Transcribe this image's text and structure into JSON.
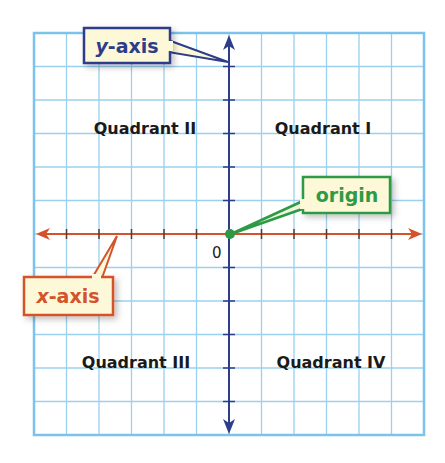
{
  "diagram": {
    "grid": {
      "columns": 12,
      "rows": 12,
      "line_color": "#9bd0ee",
      "border_color": "#7cc2ea"
    },
    "axes": {
      "x": {
        "label": "x-axis",
        "label_italic_part": "x",
        "label_rest": "-axis",
        "color": "#d4532a"
      },
      "y": {
        "label": "y-axis",
        "label_italic_part": "y",
        "label_rest": "-axis",
        "color": "#2e3d8a"
      }
    },
    "origin": {
      "label": "origin",
      "zero_label": "0",
      "color": "#2e9a46"
    },
    "quadrants": [
      {
        "id": "I",
        "label": "Quadrant I"
      },
      {
        "id": "II",
        "label": "Quadrant II"
      },
      {
        "id": "III",
        "label": "Quadrant III"
      },
      {
        "id": "IV",
        "label": "Quadrant IV"
      }
    ],
    "callout_fill": "#fdf8d8"
  }
}
